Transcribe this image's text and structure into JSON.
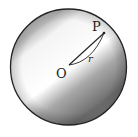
{
  "diagram": {
    "type": "sphere",
    "labels": {
      "center": "O",
      "point": "P",
      "radius": "r"
    },
    "colors": {
      "outline": "#222222",
      "shade_dark": "#5a5a5a",
      "shade_light": "#ffffff"
    }
  }
}
